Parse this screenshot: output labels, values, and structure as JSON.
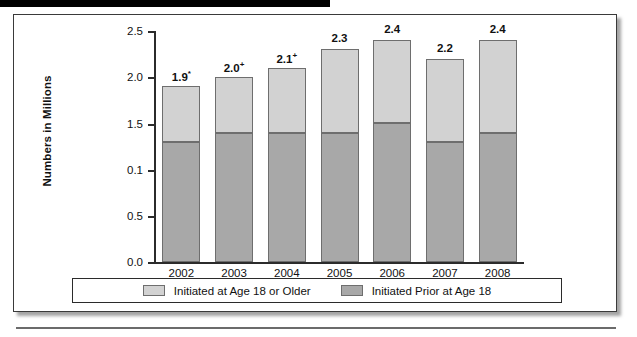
{
  "figure": {
    "background_color": "#ffffff",
    "frame_color": "#3a3a3a"
  },
  "chart_data": {
    "type": "bar",
    "subtype": "stacked-vertical",
    "title": "",
    "subtitle": "",
    "xlabel": "",
    "ylabel": "Numbers in Millions",
    "categories": [
      "2002",
      "2003",
      "2004",
      "2005",
      "2006",
      "2007",
      "2008"
    ],
    "ylim": [
      0.0,
      2.5
    ],
    "ytick_labels": [
      "2.5",
      "2.0",
      "1.5",
      "0.1",
      "0.5",
      "0.0"
    ],
    "ytick_values": [
      2.5,
      2.0,
      1.5,
      1.0,
      0.5,
      0.0
    ],
    "grid": false,
    "legend_position": "bottom",
    "series": [
      {
        "name": "Initiated Prior at Age 18",
        "color": "#a8a8a8",
        "values": [
          1.3,
          1.4,
          1.4,
          1.4,
          1.5,
          1.3,
          1.4
        ]
      },
      {
        "name": "Initiated at Age 18 or Older",
        "color": "#d2d2d2",
        "values": [
          0.6,
          0.6,
          0.7,
          0.9,
          0.9,
          0.9,
          1.0
        ]
      }
    ],
    "totals": [
      1.9,
      2.0,
      2.1,
      2.3,
      2.4,
      2.2,
      2.4
    ],
    "data_labels": [
      {
        "value": "1.9",
        "marker": "*"
      },
      {
        "value": "2.0",
        "marker": "+"
      },
      {
        "value": "2.1",
        "marker": "+"
      },
      {
        "value": "2.3",
        "marker": ""
      },
      {
        "value": "2.4",
        "marker": ""
      },
      {
        "value": "2.2",
        "marker": ""
      },
      {
        "value": "2.4",
        "marker": ""
      }
    ]
  },
  "legend": {
    "items": [
      {
        "label": "Initiated at Age 18 or Older",
        "color": "#d2d2d2"
      },
      {
        "label": "Initiated Prior at Age 18",
        "color": "#a8a8a8"
      }
    ]
  }
}
